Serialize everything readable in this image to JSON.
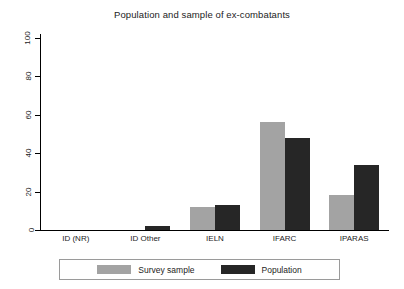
{
  "chart_data": {
    "type": "bar",
    "title": "Population and sample of ex-combatants",
    "xlabel": "",
    "ylabel": "",
    "categories": [
      "ID (NR)",
      "ID Other",
      "IELN",
      "IFARC",
      "IPARAS"
    ],
    "series": [
      {
        "name": "Survey sample",
        "color": "#a3a3a3",
        "values": [
          0,
          0,
          12,
          56,
          18
        ]
      },
      {
        "name": "Population",
        "color": "#262626",
        "values": [
          0,
          2,
          13,
          48,
          34
        ]
      }
    ],
    "ylim": [
      0,
      100
    ],
    "yticks": [
      0,
      20,
      40,
      60,
      80,
      100
    ],
    "ytick_labels": [
      "0",
      "20",
      "40",
      "60",
      "80",
      "100"
    ],
    "grid": false,
    "legend_position": "bottom",
    "legend": [
      "Survey sample",
      "Population"
    ]
  },
  "legend": {
    "survey_label": "Survey sample",
    "population_label": "Population"
  }
}
